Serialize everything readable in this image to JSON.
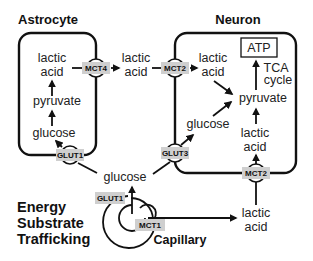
{
  "diagram": {
    "title_lines": [
      "Energy",
      "Substrate",
      "Trafficking"
    ],
    "cells": {
      "astrocyte": {
        "label": "Astrocyte",
        "metabolites": {
          "lactic1": "lactic",
          "lactic2": "acid",
          "pyruvate": "pyruvate",
          "glucose": "glucose"
        }
      },
      "neuron": {
        "label": "Neuron",
        "atp": "ATP",
        "tca1": "TCA",
        "tca2": "cycle",
        "metabolites": {
          "lactic_top1": "lactic",
          "lactic_top2": "acid",
          "pyruvate": "pyruvate",
          "glucose": "glucose",
          "lactic_bot1": "lactic",
          "lactic_bot2": "acid"
        }
      },
      "capillary": {
        "label": "Capillary"
      }
    },
    "extracellular": {
      "lactic1": "lactic",
      "lactic2": "acid",
      "glucose": "glucose",
      "cap_lactic1": "lactic",
      "cap_lactic2": "acid"
    },
    "transporters": {
      "mct4": "MCT4",
      "mct2_top": "MCT2",
      "glut1_astro": "GLUT1",
      "glut3": "GLUT3",
      "mct2_bottom": "MCT2",
      "glut1_cap": "GLUT1",
      "mct1": "MCT1"
    },
    "colors": {
      "line": "#111111",
      "transporter_fill": "#cfcfcf",
      "text": "#222222"
    }
  }
}
